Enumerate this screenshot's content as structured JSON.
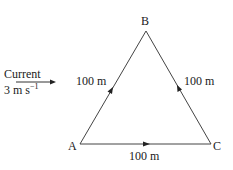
{
  "diagram": {
    "type": "triangle-vector-diagram",
    "current": {
      "label": "Current",
      "speed_value": "3 m s",
      "speed_exponent": "−1",
      "direction": "right"
    },
    "vertices": {
      "A": "A",
      "B": "B",
      "C": "C"
    },
    "sides": [
      {
        "from": "A",
        "to": "B",
        "label": "100 m",
        "arrow": "A→B"
      },
      {
        "from": "C",
        "to": "B",
        "label": "100 m",
        "arrow": "C→B"
      },
      {
        "from": "A",
        "to": "C",
        "label": "100 m",
        "arrow": "A→C"
      }
    ],
    "colors": {
      "line": "#333333",
      "text": "#1a1a1a"
    }
  }
}
